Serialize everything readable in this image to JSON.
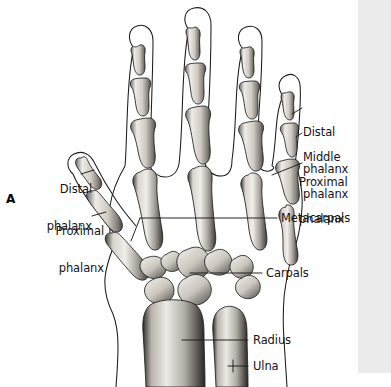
{
  "figure": {
    "panel_letter": "A",
    "background_color": "#ffffff",
    "ink_color": "#141414",
    "scan_strip_color": "#ebebeb"
  },
  "labels": {
    "right": [
      {
        "id": "distal-phalanx-right",
        "line1": "Distal",
        "line2": "phalanx"
      },
      {
        "id": "middle-phalanx-right",
        "line1": "Middle",
        "line2": "phalanx"
      },
      {
        "id": "proximal-phalanx-right",
        "line1": "Proximal",
        "line2": "phalanx"
      }
    ],
    "left": [
      {
        "id": "distal-phalanx-left",
        "line1": "Distal",
        "line2": "phalanx"
      },
      {
        "id": "proximal-phalanx-left",
        "line1": "Proximal",
        "line2": "phalanx"
      }
    ],
    "stacked_single": [
      {
        "id": "metacarpals",
        "text": "Metacarpals"
      },
      {
        "id": "carpals",
        "text": "Carpals"
      },
      {
        "id": "radius",
        "text": "Radius"
      },
      {
        "id": "ulna",
        "text": "Ulna"
      }
    ]
  },
  "anatomy": {
    "digits": [
      {
        "name": "thumb",
        "phalanges": [
          "proximal",
          "distal"
        ]
      },
      {
        "name": "index-finger",
        "phalanges": [
          "proximal",
          "middle",
          "distal"
        ]
      },
      {
        "name": "middle-finger",
        "phalanges": [
          "proximal",
          "middle",
          "distal"
        ]
      },
      {
        "name": "ring-finger",
        "phalanges": [
          "proximal",
          "middle",
          "distal"
        ]
      },
      {
        "name": "little-finger",
        "phalanges": [
          "proximal",
          "middle",
          "distal"
        ]
      }
    ],
    "metacarpal_count": 5,
    "carpal_count": 8,
    "forearm_bones": [
      "radius",
      "ulna"
    ]
  }
}
